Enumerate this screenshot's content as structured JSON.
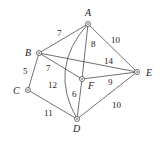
{
  "nodes": [
    {
      "id": "A",
      "x": 88,
      "y": 24,
      "lx": 85,
      "ly": 16
    },
    {
      "id": "B",
      "x": 39,
      "y": 53,
      "lx": 25,
      "ly": 56
    },
    {
      "id": "C",
      "x": 28,
      "y": 90,
      "lx": 13,
      "ly": 94
    },
    {
      "id": "D",
      "x": 77,
      "y": 119,
      "lx": 73,
      "ly": 132
    },
    {
      "id": "E",
      "x": 137,
      "y": 72,
      "lx": 146,
      "ly": 76
    },
    {
      "id": "F",
      "x": 82,
      "y": 79,
      "lx": 88,
      "ly": 89
    }
  ],
  "edges": [
    {
      "from": "A",
      "to": "B",
      "weight": "7",
      "wx": 57,
      "wy": 36
    },
    {
      "from": "A",
      "to": "E",
      "weight": "10",
      "wx": 111,
      "wy": 43
    },
    {
      "from": "A",
      "to": "F",
      "weight": "8",
      "wx": 91,
      "wy": 47
    },
    {
      "from": "A",
      "to": "D",
      "weight": "12",
      "wx": 48,
      "wy": 88,
      "curved": true
    },
    {
      "from": "B",
      "to": "E",
      "weight": "14",
      "wx": 104,
      "wy": 64
    },
    {
      "from": "B",
      "to": "F",
      "weight": "7",
      "wx": 46,
      "wy": 71
    },
    {
      "from": "B",
      "to": "C",
      "weight": "5",
      "wx": 23,
      "wy": 74
    },
    {
      "from": "C",
      "to": "D",
      "weight": "11",
      "wx": 44,
      "wy": 116
    },
    {
      "from": "F",
      "to": "D",
      "weight": "6",
      "wx": 72,
      "wy": 97
    },
    {
      "from": "F",
      "to": "E",
      "weight": "9",
      "wx": 108,
      "wy": 85
    },
    {
      "from": "D",
      "to": "E",
      "weight": "10",
      "wx": 112,
      "wy": 108
    }
  ]
}
